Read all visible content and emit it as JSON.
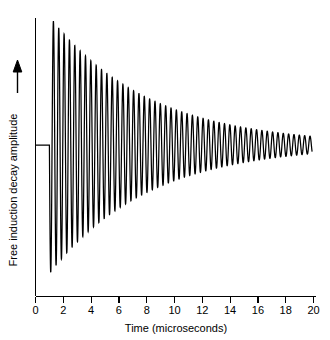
{
  "chart_data": {
    "type": "line",
    "title": "",
    "subtitle": "",
    "xlabel": "Time (microseconds)",
    "ylabel": "Free induction decay amplitude",
    "ylabel_arrow": "up-arrow",
    "xlim": [
      0,
      20
    ],
    "ylim": [
      -1.12,
      1.04
    ],
    "xticks": [
      0,
      2,
      4,
      6,
      8,
      10,
      12,
      14,
      16,
      18,
      20
    ],
    "xtick_labels": [
      "0",
      "2",
      "4",
      "6",
      "8",
      "10",
      "12",
      "14",
      "16",
      "18",
      "20"
    ],
    "yticks": [],
    "ytick_labels": [],
    "grid": false,
    "legend": null,
    "annotations": [],
    "series": [
      {
        "name": "Free induction decay",
        "color": "#000000",
        "description": "Flat baseline from t=0 to t=1 microsecond, then an exponentially damped sinusoid (FID) decaying from full amplitude to near zero by t=20 microseconds.",
        "signal_model": {
          "baseline_end_t": 1.0,
          "amplitude_at_start": 1.0,
          "decay_time_constant_us": 7.0,
          "frequency_cycles_per_us": 2.6,
          "phase_deg": 0,
          "end_t": 19.9
        },
        "envelope_points": [
          {
            "t": 1.0,
            "amplitude": 1.0
          },
          {
            "t": 2.0,
            "amplitude": 0.87
          },
          {
            "t": 3.0,
            "amplitude": 0.75
          },
          {
            "t": 4.0,
            "amplitude": 0.65
          },
          {
            "t": 5.0,
            "amplitude": 0.56
          },
          {
            "t": 6.0,
            "amplitude": 0.49
          },
          {
            "t": 7.0,
            "amplitude": 0.42
          },
          {
            "t": 8.0,
            "amplitude": 0.37
          },
          {
            "t": 9.0,
            "amplitude": 0.32
          },
          {
            "t": 10.0,
            "amplitude": 0.27
          },
          {
            "t": 11.0,
            "amplitude": 0.24
          },
          {
            "t": 12.0,
            "amplitude": 0.2
          },
          {
            "t": 13.0,
            "amplitude": 0.18
          },
          {
            "t": 14.0,
            "amplitude": 0.15
          },
          {
            "t": 15.0,
            "amplitude": 0.13
          },
          {
            "t": 16.0,
            "amplitude": 0.11
          },
          {
            "t": 17.0,
            "amplitude": 0.1
          },
          {
            "t": 18.0,
            "amplitude": 0.08
          },
          {
            "t": 19.0,
            "amplitude": 0.07
          },
          {
            "t": 19.9,
            "amplitude": 0.06
          }
        ]
      }
    ]
  }
}
